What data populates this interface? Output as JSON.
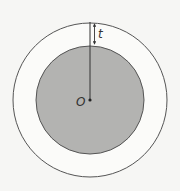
{
  "diagram": {
    "labels": {
      "center": "O",
      "thickness": "t"
    },
    "colors": {
      "background": "#f6f6f4",
      "inner_fill": "#b3b3b1",
      "stroke": "#555555"
    },
    "geometry": {
      "center": [
        90,
        100
      ],
      "outer_radius": 77,
      "inner_radius": 54
    }
  }
}
